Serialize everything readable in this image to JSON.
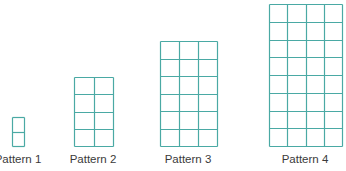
{
  "colors": {
    "grid_line": "#4aa9a4",
    "label_text": "#3a3a3a",
    "background": "#ffffff"
  },
  "patterns": [
    {
      "label": "Pattern 1",
      "columns": 1,
      "rows": 2,
      "x": 12,
      "y": 117,
      "width": 12,
      "height": 29,
      "label_x": 18,
      "label_y": 153
    },
    {
      "label": "Pattern 2",
      "columns": 2,
      "rows": 4,
      "x": 74,
      "y": 77,
      "width": 39,
      "height": 69,
      "label_x": 93,
      "label_y": 153
    },
    {
      "label": "Pattern 3",
      "columns": 3,
      "rows": 6,
      "x": 160,
      "y": 41,
      "width": 57,
      "height": 105,
      "label_x": 188,
      "label_y": 153
    },
    {
      "label": "Pattern 4",
      "columns": 4,
      "rows": 8,
      "x": 269,
      "y": 4,
      "width": 73,
      "height": 142,
      "label_x": 305,
      "label_y": 153
    }
  ]
}
